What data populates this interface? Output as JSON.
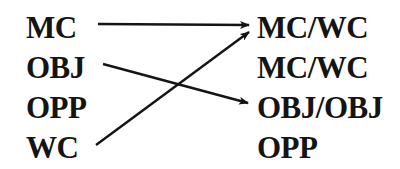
{
  "diagram": {
    "left_column": [
      {
        "label": "MC"
      },
      {
        "label": "OBJ"
      },
      {
        "label": "OPP"
      },
      {
        "label": "WC"
      }
    ],
    "right_column": [
      {
        "label": "MC/WC"
      },
      {
        "label": "MC/WC"
      },
      {
        "label": "OBJ/OBJ"
      },
      {
        "label": "OPP"
      }
    ],
    "arrows": [
      {
        "from": "MC",
        "to": "MC/WC (row 1)",
        "x1": 98,
        "y1": 24,
        "x2": 249,
        "y2": 25
      },
      {
        "from": "OBJ",
        "to": "OBJ/OBJ (row 3)",
        "x1": 103,
        "y1": 64,
        "x2": 248,
        "y2": 103
      },
      {
        "from": "WC",
        "to": "MC/WC (row 1)",
        "x1": 96,
        "y1": 145,
        "x2": 249,
        "y2": 32
      }
    ],
    "colors": {
      "text": "#141414",
      "arrow": "#141414",
      "background": "#ffffff"
    }
  }
}
